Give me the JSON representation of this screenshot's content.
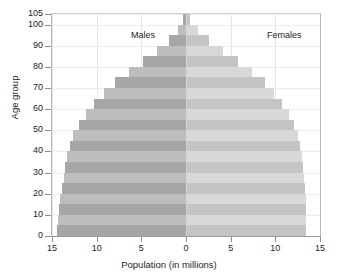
{
  "chart_data": {
    "type": "bar",
    "subtype": "population-pyramid",
    "title": "",
    "xlabel": "Population (in millions)",
    "ylabel": "Age group",
    "xlim": [
      -15,
      15
    ],
    "ylim": [
      0,
      105
    ],
    "xticks": [
      15,
      10,
      5,
      0,
      5,
      10,
      15
    ],
    "xtick_values": [
      -15,
      -10,
      -5,
      0,
      5,
      10,
      15
    ],
    "yticks": [
      0,
      10,
      20,
      30,
      40,
      50,
      60,
      70,
      80,
      90,
      100,
      105
    ],
    "grid": true,
    "legend_position": "in-plot",
    "categories": [
      "0-4",
      "5-9",
      "10-14",
      "15-19",
      "20-24",
      "25-29",
      "30-34",
      "35-39",
      "40-44",
      "45-49",
      "50-54",
      "55-59",
      "60-64",
      "65-69",
      "70-74",
      "75-79",
      "80-84",
      "85-89",
      "90-94",
      "95-99",
      "100-104"
    ],
    "series": [
      {
        "name": "Males",
        "side": "left",
        "color": "#a6a6a6",
        "color_alt": "#bdbdbd",
        "values": [
          14.4,
          14.3,
          14.2,
          14.1,
          13.9,
          13.7,
          13.5,
          13.3,
          13.0,
          12.6,
          12.0,
          11.2,
          10.3,
          9.2,
          7.9,
          6.4,
          4.8,
          3.2,
          1.9,
          0.9,
          0.3
        ]
      },
      {
        "name": "Females",
        "side": "right",
        "color": "#c4c4c4",
        "color_alt": "#d8d8d8",
        "values": [
          13.4,
          13.4,
          13.4,
          13.4,
          13.3,
          13.2,
          13.1,
          13.0,
          12.8,
          12.5,
          12.1,
          11.5,
          10.8,
          9.9,
          8.8,
          7.4,
          5.8,
          4.1,
          2.6,
          1.3,
          0.5
        ]
      }
    ],
    "annotations": [
      {
        "name": "males-label",
        "text": "Males"
      },
      {
        "name": "females-label",
        "text": "Females"
      }
    ]
  },
  "axis": {
    "ylabel": "Age group",
    "xlabel": "Population (in millions)",
    "ytick_labels": [
      "105",
      "100",
      "90",
      "80",
      "70",
      "60",
      "50",
      "40",
      "30",
      "20",
      "10",
      "0"
    ],
    "xtick_labels": [
      "15",
      "10",
      "5",
      "0",
      "5",
      "10",
      "15"
    ]
  },
  "colors": {
    "male": "#a6a6a6",
    "male_alt": "#bdbdbd",
    "female": "#c4c4c4",
    "female_alt": "#d8d8d8",
    "grid": "#e4e4e4",
    "axis": "#9a9a9a",
    "text": "#1d1d1d",
    "background": "#ffffff"
  }
}
